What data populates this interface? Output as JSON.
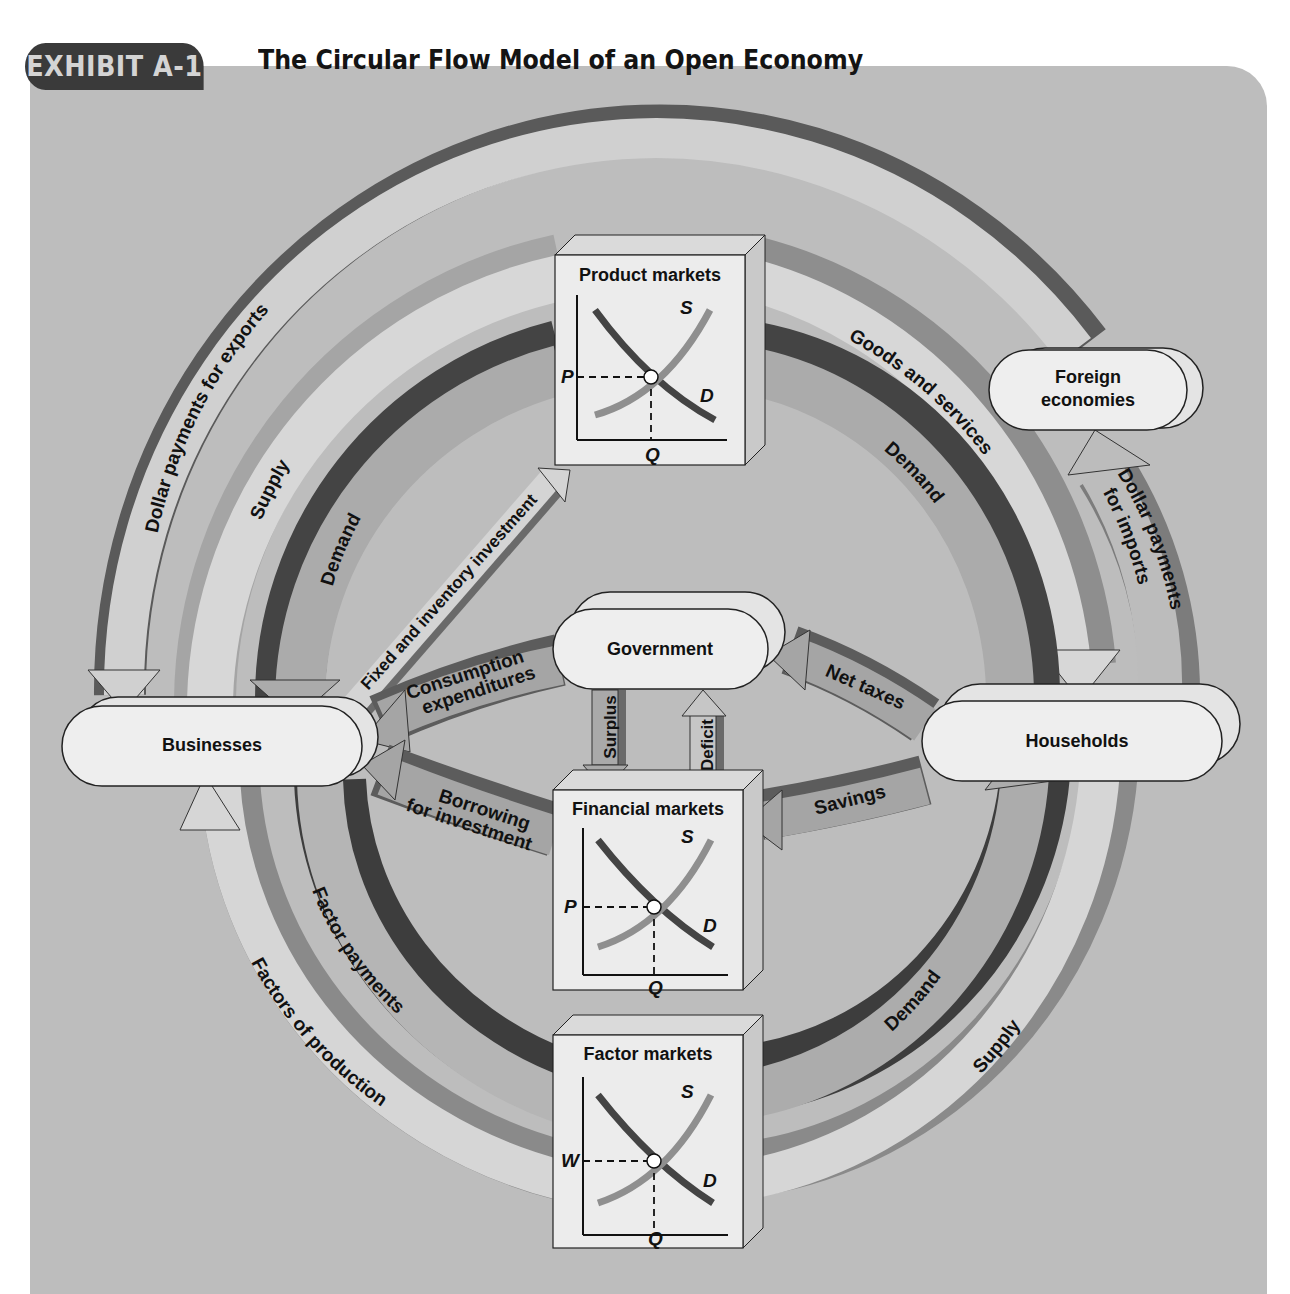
{
  "header": {
    "badge": "EXHIBIT A-1",
    "title": "The Circular Flow Model of an Open Economy"
  },
  "nodes": {
    "businesses": "Businesses",
    "households": "Households",
    "government": "Government",
    "foreign": [
      "Foreign",
      "economies"
    ]
  },
  "markets": {
    "product": {
      "title": "Product markets",
      "price_label": "P",
      "qty_label": "Q",
      "supply_label": "S",
      "demand_label": "D"
    },
    "financial": {
      "title": "Financial markets",
      "price_label": "P",
      "qty_label": "Q",
      "supply_label": "S",
      "demand_label": "D"
    },
    "factor": {
      "title": "Factor markets",
      "price_label": "W",
      "qty_label": "Q",
      "supply_label": "S",
      "demand_label": "D"
    }
  },
  "flows": {
    "dollar_exports": "Dollar payments for exports",
    "supply_top": "Supply",
    "demand_top_left": "Demand",
    "fixed_investment": "Fixed and inventory investment",
    "goods_services": "Goods and services",
    "demand_top_right": "Demand",
    "dollar_imports": [
      "Dollar payments",
      "for imports"
    ],
    "consumption": [
      "Consumption",
      "expenditures"
    ],
    "net_taxes": "Net taxes",
    "surplus": "Surplus",
    "deficit": "Deficit",
    "borrowing": [
      "Borrowing",
      "for investment"
    ],
    "savings": "Savings",
    "factor_payments": "Factor payments",
    "factors_production": "Factors of production",
    "demand_bottom_right": "Demand",
    "supply_bottom_right": "Supply"
  },
  "colors": {
    "panel": "#bdbdbd",
    "light_band": "#d2d2d2",
    "mid_band": "#a9a9a9",
    "dark_band": "#4a4a4a",
    "medium_dark": "#7c7c7c",
    "node_fill": "#ececec",
    "supply_curve": "#8f8f8f",
    "demand_curve": "#444444"
  }
}
